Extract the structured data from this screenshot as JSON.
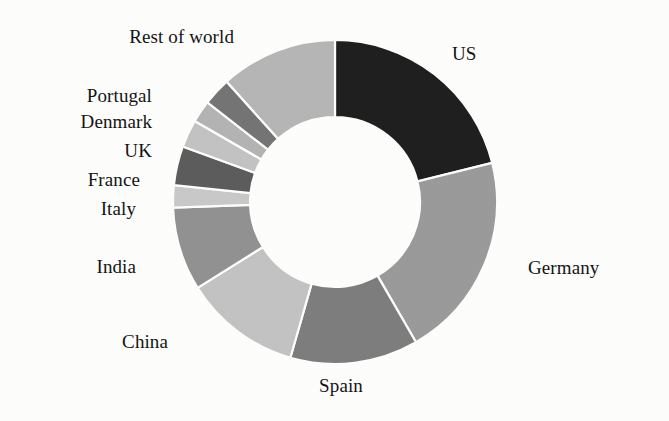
{
  "chart_data": {
    "type": "pie",
    "variant": "donut",
    "title": "",
    "subtitle": "",
    "xlabel": "",
    "ylabel": "",
    "legend_position": "none",
    "labels_placement": "outside-callout",
    "grid": false,
    "start_angle_deg": 0,
    "direction": "clockwise",
    "inner_radius_ratio": 0.52,
    "categories": [
      "US",
      "Germany",
      "Spain",
      "China",
      "India",
      "Italy",
      "France",
      "UK",
      "Denmark",
      "Portugal",
      "Rest of world"
    ],
    "values": [
      21.1,
      20.6,
      12.8,
      11.7,
      8.3,
      2.2,
      3.9,
      2.8,
      2.2,
      2.8,
      11.6
    ],
    "colors": [
      "#1f1f1f",
      "#9a9a9a",
      "#7d7d7d",
      "#c2c2c2",
      "#919191",
      "#c8c8c8",
      "#5c5c5c",
      "#c2c2c2",
      "#b3b3b3",
      "#747474",
      "#b5b5b5"
    ],
    "slices": [
      {
        "label": "US",
        "value": 21.1,
        "color": "#1f1f1f",
        "start_deg": 0.0,
        "end_deg": 76.0
      },
      {
        "label": "Germany",
        "value": 20.6,
        "color": "#9a9a9a",
        "start_deg": 76.0,
        "end_deg": 150.0
      },
      {
        "label": "Spain",
        "value": 12.8,
        "color": "#7d7d7d",
        "start_deg": 150.0,
        "end_deg": 196.0
      },
      {
        "label": "China",
        "value": 11.7,
        "color": "#c2c2c2",
        "start_deg": 196.0,
        "end_deg": 238.0
      },
      {
        "label": "India",
        "value": 8.3,
        "color": "#919191",
        "start_deg": 238.0,
        "end_deg": 268.0
      },
      {
        "label": "Italy",
        "value": 2.2,
        "color": "#c8c8c8",
        "start_deg": 268.0,
        "end_deg": 276.0
      },
      {
        "label": "France",
        "value": 3.9,
        "color": "#5c5c5c",
        "start_deg": 276.0,
        "end_deg": 290.0
      },
      {
        "label": "UK",
        "value": 2.8,
        "color": "#c2c2c2",
        "start_deg": 290.0,
        "end_deg": 300.0
      },
      {
        "label": "Denmark",
        "value": 2.2,
        "color": "#b3b3b3",
        "start_deg": 300.0,
        "end_deg": 308.0
      },
      {
        "label": "Portugal",
        "value": 2.8,
        "color": "#747474",
        "start_deg": 308.0,
        "end_deg": 318.0
      },
      {
        "label": "Rest of world",
        "value": 11.6,
        "color": "#b5b5b5",
        "start_deg": 318.0,
        "end_deg": 360.0
      }
    ]
  },
  "labels": {
    "us": "US",
    "germany": "Germany",
    "spain": "Spain",
    "china": "China",
    "india": "India",
    "italy": "Italy",
    "france": "France",
    "uk": "UK",
    "denmark": "Denmark",
    "portugal": "Portugal",
    "rest_of_world": "Rest of world"
  },
  "geometry": {
    "center_x": 335,
    "center_y": 202,
    "outer_radius": 162,
    "inner_radius": 85
  },
  "style": {
    "background": "#fdfdfb",
    "text_color": "#141414",
    "slice_border": "#fdfdfb"
  }
}
